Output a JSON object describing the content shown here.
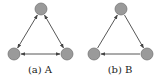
{
  "figures": [
    {
      "id": "a",
      "caption": "(a) A",
      "nodes": [
        {
          "name": "top",
          "x": 41,
          "y": 9
        },
        {
          "name": "bottom-left",
          "x": 14,
          "y": 54
        },
        {
          "name": "bottom-right",
          "x": 67,
          "y": 54
        }
      ],
      "edges": [
        {
          "from": "top",
          "to": "bottom-left",
          "bidirectional": true
        },
        {
          "from": "top",
          "to": "bottom-right",
          "bidirectional": true
        },
        {
          "from": "bottom-left",
          "to": "bottom-right",
          "bidirectional": true
        }
      ]
    },
    {
      "id": "b",
      "caption": "(b) B",
      "nodes": [
        {
          "name": "top",
          "x": 41,
          "y": 9
        },
        {
          "name": "bottom-left",
          "x": 14,
          "y": 54
        },
        {
          "name": "bottom-right",
          "x": 67,
          "y": 54
        }
      ],
      "edges": [
        {
          "from": "bottom-left",
          "to": "top",
          "bidirectional": false
        },
        {
          "from": "top",
          "to": "bottom-right",
          "bidirectional": false
        },
        {
          "from": "bottom-right",
          "to": "bottom-left",
          "bidirectional": false
        }
      ]
    }
  ],
  "style": {
    "node_fill": "#9a9a9a",
    "node_stroke": "#6e6e6e",
    "edge_color": "#444444",
    "node_radius": 6
  }
}
